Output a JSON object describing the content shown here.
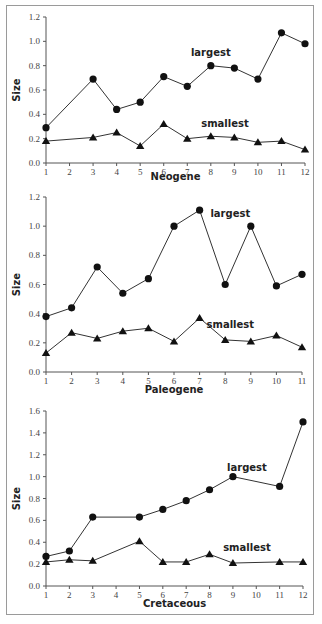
{
  "chart_data": [
    {
      "type": "line",
      "title": "",
      "xlabel": "Neogene",
      "ylabel": "Size",
      "ylim": [
        0,
        1.2
      ],
      "yticks": [
        "0.0",
        "0.2",
        "0.4",
        "0.6",
        "0.8",
        "1.0",
        "1.2"
      ],
      "xticks": [
        "1",
        "2",
        "3",
        "4",
        "5",
        "6",
        "7",
        "8",
        "9",
        "10",
        "11",
        "12"
      ],
      "grid": false,
      "series": [
        {
          "name": "largest",
          "marker": "circle",
          "x": [
            1,
            3,
            4,
            5,
            6,
            7,
            8,
            9,
            10,
            11,
            12
          ],
          "values": [
            0.29,
            0.69,
            0.44,
            0.5,
            0.71,
            0.63,
            0.8,
            0.78,
            0.69,
            1.07,
            0.98
          ]
        },
        {
          "name": "smallest",
          "marker": "triangle",
          "x": [
            1,
            3,
            4,
            5,
            6,
            7,
            8,
            9,
            10,
            11,
            12
          ],
          "values": [
            0.18,
            0.21,
            0.25,
            0.14,
            0.32,
            0.2,
            0.22,
            0.21,
            0.17,
            0.18,
            0.11
          ]
        }
      ],
      "labels": [
        {
          "text": "largest",
          "x": 8,
          "y": 0.88
        },
        {
          "text": "smallest",
          "x": 8.6,
          "y": 0.3
        }
      ]
    },
    {
      "type": "line",
      "title": "",
      "xlabel": "Paleogene",
      "ylabel": "Size",
      "ylim": [
        0,
        1.2
      ],
      "yticks": [
        "0.0",
        "0.2",
        "0.4",
        "0.6",
        "0.8",
        "1.0",
        "1.2"
      ],
      "xticks": [
        "1",
        "2",
        "3",
        "4",
        "5",
        "6",
        "7",
        "8",
        "9",
        "10",
        "11"
      ],
      "grid": false,
      "series": [
        {
          "name": "largest",
          "marker": "circle",
          "x": [
            1,
            2,
            3,
            4,
            5,
            6,
            7,
            8,
            9,
            10,
            11
          ],
          "values": [
            0.38,
            0.44,
            0.72,
            0.54,
            0.64,
            1.0,
            1.11,
            0.6,
            1.0,
            0.59,
            0.67
          ]
        },
        {
          "name": "smallest",
          "marker": "triangle",
          "x": [
            1,
            2,
            3,
            4,
            5,
            6,
            7,
            8,
            9,
            10,
            11
          ],
          "values": [
            0.13,
            0.27,
            0.23,
            0.28,
            0.3,
            0.21,
            0.37,
            0.22,
            0.21,
            0.25,
            0.17
          ]
        }
      ],
      "labels": [
        {
          "text": "largest",
          "x": 8.2,
          "y": 1.06
        },
        {
          "text": "smallest",
          "x": 8.2,
          "y": 0.3
        }
      ]
    },
    {
      "type": "line",
      "title": "",
      "xlabel": "Cretaceous",
      "ylabel": "Size",
      "ylim": [
        0,
        1.6
      ],
      "yticks": [
        "0.0",
        "0.2",
        "0.4",
        "0.6",
        "0.8",
        "1.0",
        "1.2",
        "1.4",
        "1.6"
      ],
      "xticks": [
        "1",
        "2",
        "3",
        "4",
        "5",
        "6",
        "7",
        "8",
        "9",
        "10",
        "11",
        "12"
      ],
      "grid": false,
      "series": [
        {
          "name": "largest",
          "marker": "circle",
          "x": [
            1,
            2,
            3,
            5,
            6,
            7,
            8,
            9,
            11,
            12
          ],
          "values": [
            0.27,
            0.32,
            0.63,
            0.63,
            0.7,
            0.78,
            0.88,
            1.0,
            0.91,
            1.5
          ]
        },
        {
          "name": "smallest",
          "marker": "triangle",
          "x": [
            1,
            2,
            3,
            5,
            6,
            7,
            8,
            9,
            11,
            12
          ],
          "values": [
            0.22,
            0.24,
            0.23,
            0.41,
            0.22,
            0.22,
            0.29,
            0.21,
            0.22,
            0.22
          ]
        }
      ],
      "labels": [
        {
          "text": "largest",
          "x": 9.6,
          "y": 1.05
        },
        {
          "text": "smallest",
          "x": 9.6,
          "y": 0.32
        }
      ]
    }
  ],
  "panels": [
    {
      "ylabel": "Size",
      "xlabel": "Neogene"
    },
    {
      "ylabel": "Size",
      "xlabel": "Paleogene"
    },
    {
      "ylabel": "Size",
      "xlabel": "Cretaceous"
    }
  ]
}
